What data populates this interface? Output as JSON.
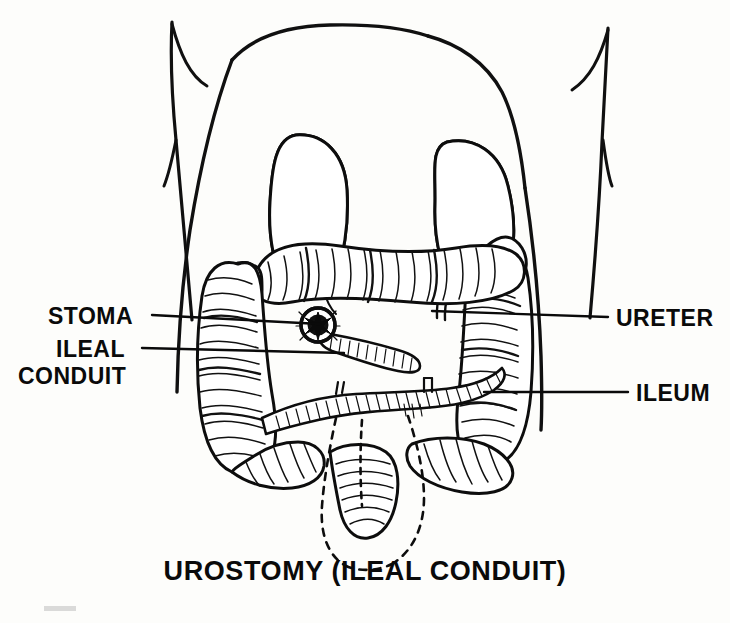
{
  "figure": {
    "caption": "UROSTOMY (ILEAL CONDUIT)",
    "background_color": "#fdfdfb",
    "ink_color": "#0a0a0a"
  },
  "labels": {
    "stoma": {
      "text": "STOMA",
      "side": "left",
      "text_x": 48,
      "text_y": 323,
      "leader_from_x": 152,
      "leader_from_y": 315,
      "leader_to_x": 318,
      "leader_to_y": 325
    },
    "ileal_conduit_line1": {
      "text": "ILEAL",
      "side": "left",
      "text_x": 55,
      "text_y": 356
    },
    "ileal_conduit_line2": {
      "text": "CONDUIT",
      "side": "left",
      "text_x": 18,
      "text_y": 382
    },
    "ileal_conduit_leader": {
      "leader_from_x": 140,
      "leader_from_y": 348,
      "leader_to_x": 340,
      "leader_to_y": 352
    },
    "ureter": {
      "text": "URETER",
      "side": "right",
      "text_x": 614,
      "text_y": 325,
      "leader_from_x": 608,
      "leader_from_y": 317,
      "leader_to_x": 430,
      "leader_to_y": 312
    },
    "ileum": {
      "text": "ILEUM",
      "side": "right",
      "text_x": 634,
      "text_y": 400,
      "leader_from_x": 628,
      "leader_from_y": 392,
      "leader_to_x": 480,
      "leader_to_y": 392
    }
  },
  "anatomy": {
    "kidney_left": "left-kidney",
    "kidney_right": "right-kidney",
    "colon": "large-intestine-colon",
    "stoma": "stoma-opening",
    "ileal_conduit": "ileal-conduit-segment",
    "ileum": "ileum-loop",
    "ureter": "ureter-tube",
    "bladder_outline": "removed-bladder-dashed-outline",
    "torso": "abdominal-torso-outline"
  }
}
